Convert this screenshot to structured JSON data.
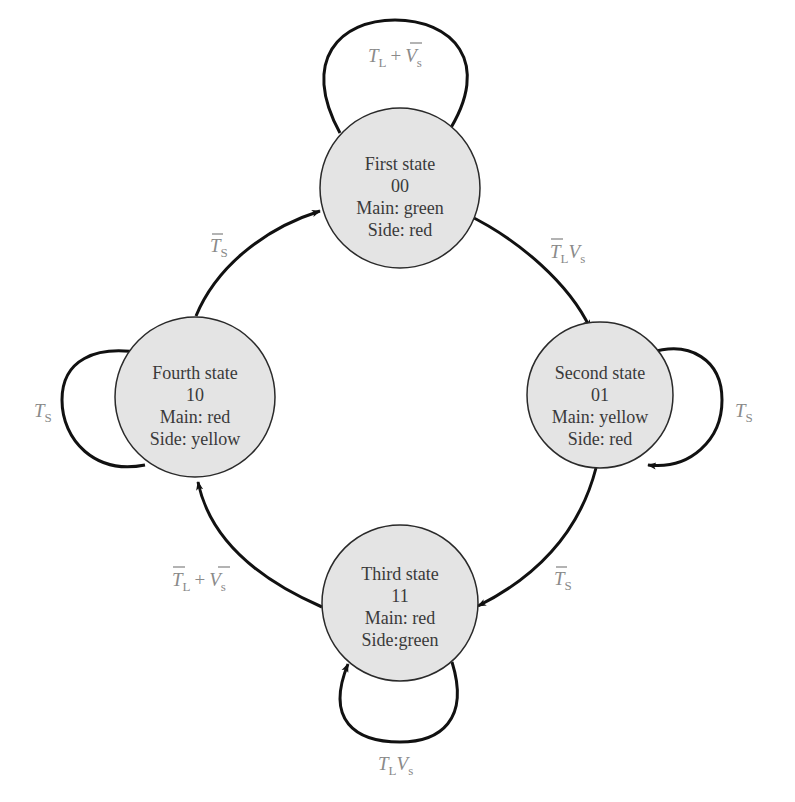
{
  "diagram": {
    "type": "state-transition-diagram",
    "colors": {
      "state_fill": "#e4e4e4",
      "state_stroke": "#2a2a2a",
      "edge": "#111111",
      "label": "#8a8a8a",
      "state_text": "#3a3a3a"
    },
    "states": [
      {
        "id": "first",
        "name": "First state",
        "code": "00",
        "main": "Main: green",
        "side": "Side: red"
      },
      {
        "id": "second",
        "name": "Second state",
        "code": "01",
        "main": "Main: yellow",
        "side": "Side: red"
      },
      {
        "id": "third",
        "name": "Third state",
        "code": "11",
        "main": "Main: red",
        "side": "Side:green"
      },
      {
        "id": "fourth",
        "name": "Fourth state",
        "code": "10",
        "main": "Main: red",
        "side": "Side: yellow"
      }
    ],
    "transitions": [
      {
        "from": "first",
        "to": "first",
        "label": "T_L + V̄_s",
        "parts": {
          "a": "T",
          "a_sub": "L",
          "op": "+",
          "b": "V",
          "b_sub": "s"
        }
      },
      {
        "from": "first",
        "to": "second",
        "label": "T̄_L V_s",
        "parts": {
          "a": "T",
          "a_sub": "L",
          "b": "V",
          "b_sub": "s"
        }
      },
      {
        "from": "second",
        "to": "second",
        "label": "T_S",
        "parts": {
          "a": "T",
          "a_sub": "S"
        }
      },
      {
        "from": "second",
        "to": "third",
        "label": "T̄_S",
        "parts": {
          "a": "T",
          "a_sub": "S"
        }
      },
      {
        "from": "third",
        "to": "third",
        "label": "T_L V_s",
        "parts": {
          "a": "T",
          "a_sub": "L",
          "b": "V",
          "b_sub": "s"
        }
      },
      {
        "from": "third",
        "to": "fourth",
        "label": "T̄_L + V̄_s",
        "parts": {
          "a": "T",
          "a_sub": "L",
          "op": "+",
          "b": "V",
          "b_sub": "s"
        }
      },
      {
        "from": "fourth",
        "to": "fourth",
        "label": "T_S",
        "parts": {
          "a": "T",
          "a_sub": "S"
        }
      },
      {
        "from": "fourth",
        "to": "first",
        "label": "T̄_S",
        "parts": {
          "a": "T",
          "a_sub": "S"
        }
      }
    ]
  }
}
